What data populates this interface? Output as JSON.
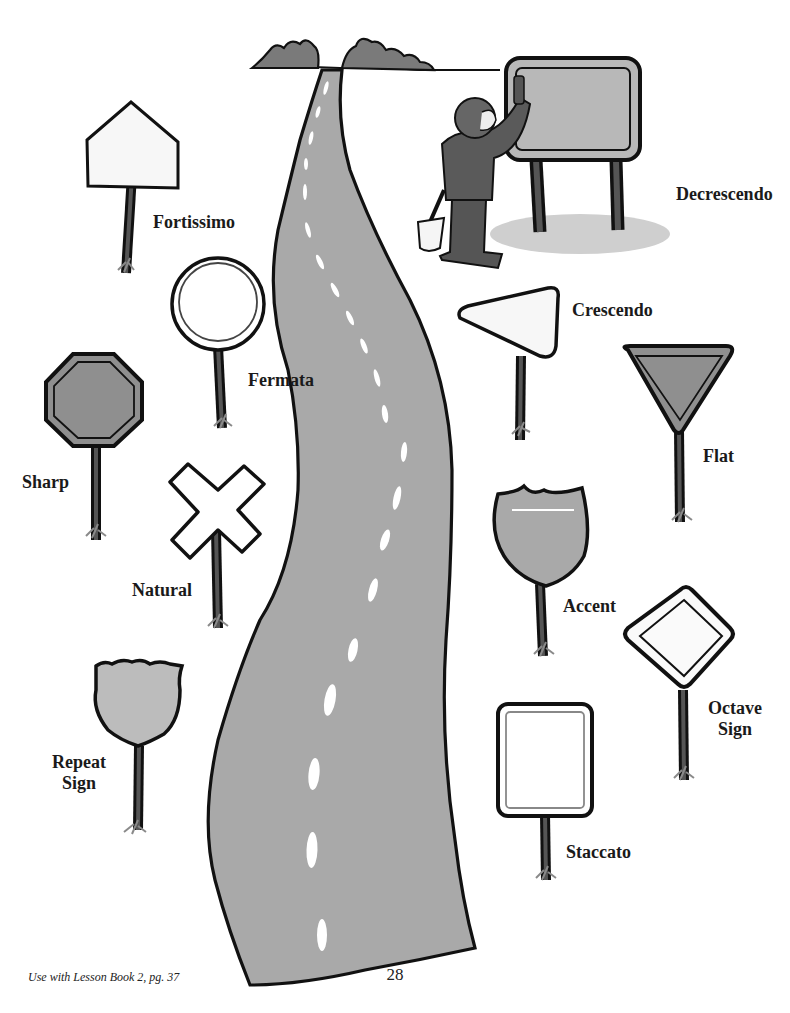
{
  "page": {
    "clipped_header_text": "",
    "page_number": "28",
    "footer_note": "Use with Lesson Book 2, pg. 37"
  },
  "colors": {
    "road": "#a9a9a9",
    "outline": "#111111",
    "dark_gray": "#6e6e6e",
    "mid_gray": "#8f8f8f",
    "light_gray": "#bcbcbc",
    "sign_white": "#fbfbfb",
    "grass": "#8a8a8a"
  },
  "signs": [
    {
      "id": "fortissimo",
      "label": "Fortissimo",
      "shape": "pentagon"
    },
    {
      "id": "decrescendo",
      "label": "Decrescendo",
      "shape": "billboard"
    },
    {
      "id": "fermata",
      "label": "Fermata",
      "shape": "circle"
    },
    {
      "id": "crescendo",
      "label": "Crescendo",
      "shape": "triangle-pointing-left"
    },
    {
      "id": "sharp",
      "label": "Sharp",
      "shape": "octagon"
    },
    {
      "id": "flat",
      "label": "Flat",
      "shape": "inverted-triangle"
    },
    {
      "id": "natural",
      "label": "Natural",
      "shape": "x-crossbuck"
    },
    {
      "id": "accent",
      "label": "Accent",
      "shape": "interstate-shield"
    },
    {
      "id": "octave-sign",
      "label_line1": "Octave",
      "label_line2": "Sign",
      "shape": "diamond"
    },
    {
      "id": "repeat-sign",
      "label_line1": "Repeat",
      "label_line2": "Sign",
      "shape": "us-route-shield"
    },
    {
      "id": "staccato",
      "label": "Staccato",
      "shape": "rectangle"
    }
  ]
}
